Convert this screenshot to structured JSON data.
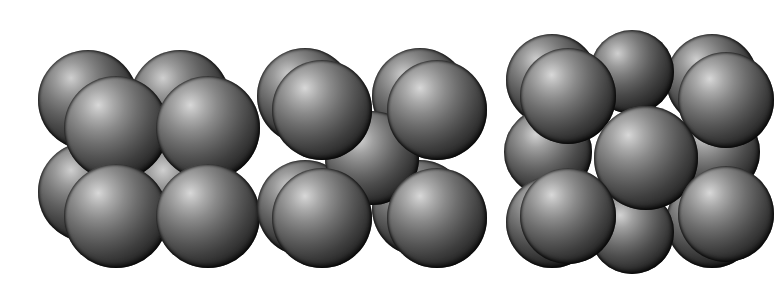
{
  "figure": {
    "title": "Crystal lattice unit cells (space-filling sphere models)",
    "background_color": "#ffffff",
    "width": 784,
    "height": 294,
    "sphere_colors": {
      "highlight": "#d8d8d8",
      "midtone": "#6e6e6e",
      "shadow": "#0d0d0d",
      "rim": "#070707"
    }
  },
  "cells": [
    {
      "id": "simple-cubic",
      "name": "Simple cubic unit cell",
      "atom_count": 8,
      "description": "Eight spheres at the cube corners, four in the back layer and four in the front layer.",
      "atoms": [
        {
          "label": "back-top-left",
          "layer": "back",
          "cx": 88,
          "cy": 100,
          "r": 50
        },
        {
          "label": "back-top-right",
          "layer": "back",
          "cx": 180,
          "cy": 100,
          "r": 50
        },
        {
          "label": "back-bottom-left",
          "layer": "back",
          "cx": 88,
          "cy": 192,
          "r": 50
        },
        {
          "label": "back-bottom-right",
          "layer": "back",
          "cx": 180,
          "cy": 192,
          "r": 50
        },
        {
          "label": "front-top-left",
          "layer": "front",
          "cx": 116,
          "cy": 128,
          "r": 52
        },
        {
          "label": "front-top-right",
          "layer": "front",
          "cx": 208,
          "cy": 128,
          "r": 52
        },
        {
          "label": "front-bottom-left",
          "layer": "front",
          "cx": 116,
          "cy": 216,
          "r": 52
        },
        {
          "label": "front-bottom-right",
          "layer": "front",
          "cx": 208,
          "cy": 216,
          "r": 52
        }
      ]
    },
    {
      "id": "body-centered-cubic",
      "name": "Body-centered cubic unit cell",
      "atom_count": 9,
      "description": "Eight corner spheres plus one sphere at the centre of the cube body.",
      "atoms": [
        {
          "label": "back-top-left",
          "layer": "back",
          "cx": 305,
          "cy": 96,
          "r": 48
        },
        {
          "label": "back-top-right",
          "layer": "back",
          "cx": 420,
          "cy": 96,
          "r": 48
        },
        {
          "label": "back-bottom-left",
          "layer": "back",
          "cx": 305,
          "cy": 208,
          "r": 48
        },
        {
          "label": "back-bottom-right",
          "layer": "back",
          "cx": 420,
          "cy": 208,
          "r": 48
        },
        {
          "label": "body-center",
          "layer": "inner",
          "cx": 372,
          "cy": 158,
          "r": 47
        },
        {
          "label": "front-top-left",
          "layer": "front",
          "cx": 322,
          "cy": 110,
          "r": 50
        },
        {
          "label": "front-top-right",
          "layer": "front",
          "cx": 437,
          "cy": 110,
          "r": 50
        },
        {
          "label": "front-bottom-left",
          "layer": "front",
          "cx": 322,
          "cy": 218,
          "r": 50
        },
        {
          "label": "front-bottom-right",
          "layer": "front",
          "cx": 437,
          "cy": 218,
          "r": 50
        }
      ]
    },
    {
      "id": "face-centered-cubic",
      "name": "Face-centered cubic unit cell",
      "atom_count": 13,
      "description": "Corner spheres plus spheres centred on each cube face, giving a close-packed appearance.",
      "atoms": [
        {
          "label": "back-top-left",
          "layer": "back",
          "cx": 552,
          "cy": 80,
          "r": 46
        },
        {
          "label": "back-top-right",
          "layer": "back",
          "cx": 712,
          "cy": 80,
          "r": 46
        },
        {
          "label": "top-face-center",
          "layer": "back",
          "cx": 632,
          "cy": 72,
          "r": 42
        },
        {
          "label": "left-face-center",
          "layer": "inner",
          "cx": 548,
          "cy": 152,
          "r": 44
        },
        {
          "label": "right-face-center",
          "layer": "inner",
          "cx": 716,
          "cy": 152,
          "r": 44
        },
        {
          "label": "back-bottom-left",
          "layer": "back",
          "cx": 552,
          "cy": 222,
          "r": 46
        },
        {
          "label": "back-bottom-right",
          "layer": "back",
          "cx": 712,
          "cy": 222,
          "r": 46
        },
        {
          "label": "bottom-face-center",
          "layer": "inner",
          "cx": 632,
          "cy": 232,
          "r": 42
        },
        {
          "label": "front-top-left",
          "layer": "front",
          "cx": 568,
          "cy": 96,
          "r": 48
        },
        {
          "label": "front-top-right",
          "layer": "front",
          "cx": 726,
          "cy": 100,
          "r": 48
        },
        {
          "label": "front-face-center",
          "layer": "front",
          "cx": 646,
          "cy": 158,
          "r": 52
        },
        {
          "label": "front-bottom-left",
          "layer": "front",
          "cx": 568,
          "cy": 216,
          "r": 48
        },
        {
          "label": "front-bottom-right",
          "layer": "front",
          "cx": 726,
          "cy": 214,
          "r": 48
        }
      ]
    }
  ]
}
